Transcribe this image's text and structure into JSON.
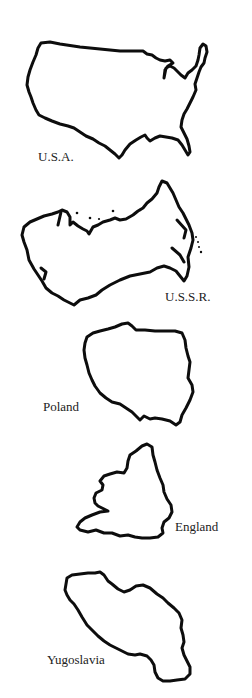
{
  "figure": {
    "background": "#ffffff",
    "outline_color": "#0d0d0d",
    "label_color": "#222222",
    "shapes": [
      {
        "name": "U.S.A.",
        "label": "U.S.A.",
        "label_pos": [
          38,
          150
        ]
      },
      {
        "name": "U.S.S.R.",
        "label": "U.S.S.R.",
        "label_pos": [
          165,
          290
        ]
      },
      {
        "name": "Poland",
        "label": "Poland",
        "label_pos": [
          43,
          400
        ]
      },
      {
        "name": "England",
        "label": "England",
        "label_pos": [
          175,
          520
        ]
      },
      {
        "name": "Yugoslavia",
        "label": "Yugoslavia",
        "label_pos": [
          47,
          653
        ]
      }
    ]
  }
}
